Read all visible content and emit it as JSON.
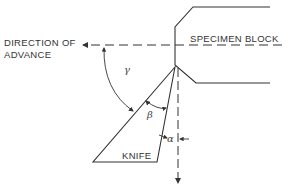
{
  "diagram": {
    "labels": {
      "direction_line1": "DIRECTION OF",
      "direction_line2": "ADVANCE",
      "specimen_block": "SPECIMEN BLOCK",
      "knife": "KNIFE",
      "gamma": "γ",
      "beta": "β",
      "alpha": "α"
    },
    "colors": {
      "stroke": "#333333",
      "background": "#ffffff"
    }
  }
}
